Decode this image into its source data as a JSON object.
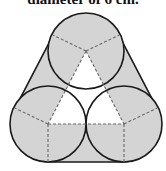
{
  "caption": "diameter of 6 cm.",
  "figure": {
    "circle_radius_px": 38,
    "circles": [
      {
        "name": "top",
        "cx": 86,
        "cy": 51
      },
      {
        "name": "left",
        "cx": 48,
        "cy": 124
      },
      {
        "name": "right",
        "cx": 124,
        "cy": 124
      }
    ],
    "colors": {
      "fill": "#d4d4d4",
      "stroke": "#1a1a1a",
      "dash": "#666666",
      "inner_triangle": "#ffffff"
    }
  }
}
